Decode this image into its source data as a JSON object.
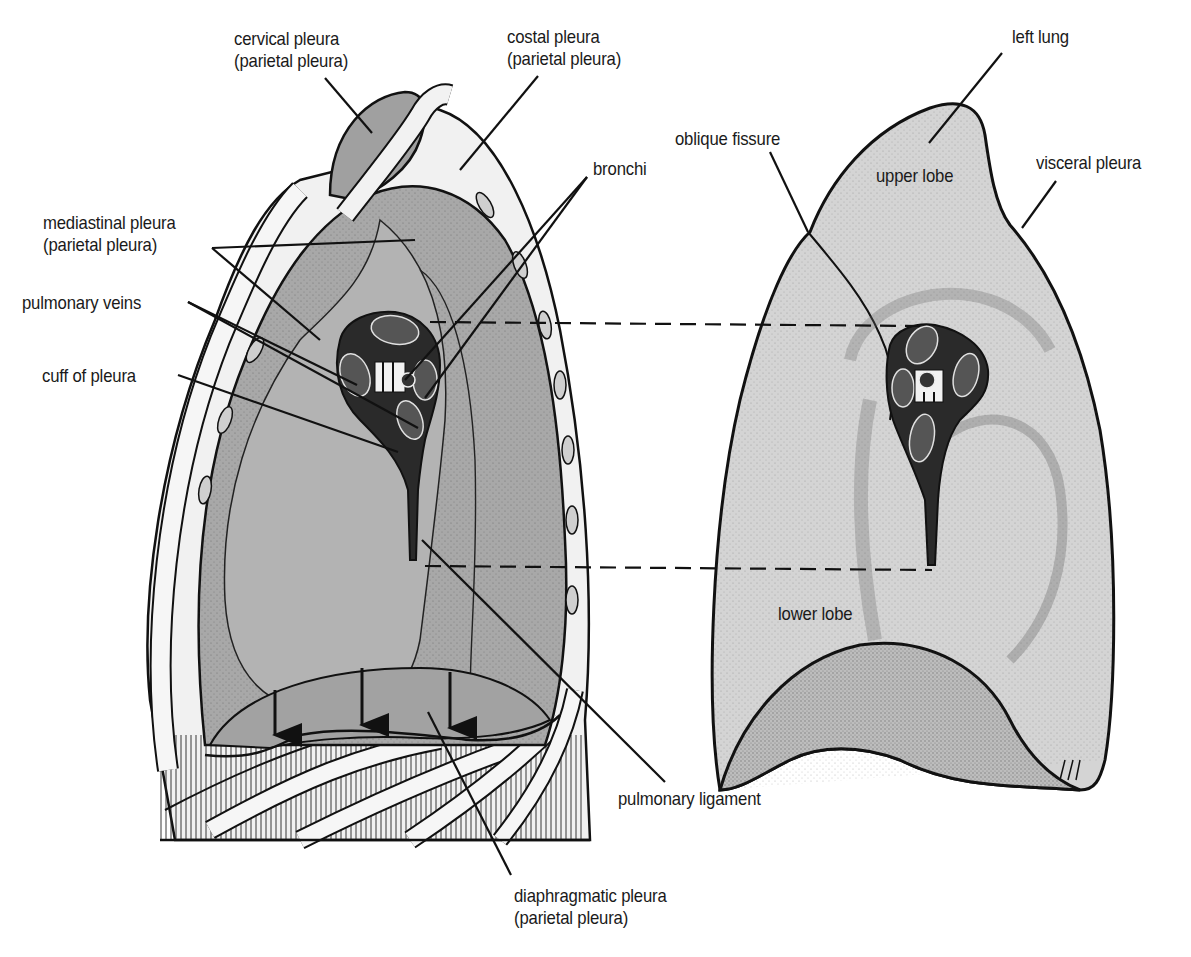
{
  "figure": {
    "left_panel": "thoracic cavity, mediastinal view (parietal pleura)",
    "right_panel": "left lung, medial surface"
  },
  "labels": {
    "cervical_pleura": {
      "line1": "cervical pleura",
      "line2": "(parietal pleura)"
    },
    "costal_pleura": {
      "line1": "costal pleura",
      "line2": "(parietal pleura)"
    },
    "mediastinal_pleura": {
      "line1": "mediastinal pleura",
      "line2": "(parietal pleura)"
    },
    "pulmonary_veins": {
      "line1": "pulmonary veins"
    },
    "cuff_of_pleura": {
      "line1": "cuff of pleura"
    },
    "bronchi": {
      "line1": "bronchi"
    },
    "oblique_fissure": {
      "line1": "oblique fissure"
    },
    "left_lung": {
      "line1": "left lung"
    },
    "upper_lobe": {
      "line1": "upper lobe"
    },
    "visceral_pleura": {
      "line1": "visceral pleura"
    },
    "lower_lobe": {
      "line1": "lower lobe"
    },
    "pulmonary_ligament": {
      "line1": "pulmonary ligament"
    },
    "diaphragmatic_pleura": {
      "line1": "diaphragmatic pleura",
      "line2": "(parietal pleura)"
    }
  },
  "colors": {
    "ink": "#111111",
    "parietal_grey": "#a9a9a9",
    "lung_grey": "#d3d3d3",
    "dark_stipple": "#7a7a7a",
    "rib_white": "#f4f4f4",
    "background": "#ffffff"
  }
}
